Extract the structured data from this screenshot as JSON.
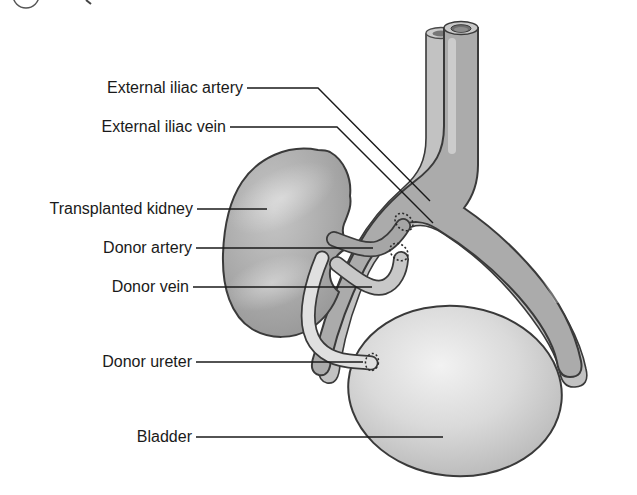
{
  "labels": {
    "external_iliac_artery": "External iliac artery",
    "external_iliac_vein": "External iliac vein",
    "transplanted_kidney": "Transplanted kidney",
    "donor_artery": "Donor artery",
    "donor_vein": "Donor vein",
    "donor_ureter": "Donor ureter",
    "bladder": "Bladder"
  },
  "colors": {
    "background": "#ffffff",
    "label_text": "#1a1a1a",
    "leader_line": "#1a1a1a",
    "outline": "#3a3a3a",
    "artery_fill": "#ababab",
    "vein_fill": "#c2c2c2",
    "donor_artery_fill": "#a6a6a6",
    "donor_vein_fill": "#c8c8c8",
    "ureter_fill": "#e0e0e0",
    "kidney_fill": "#a8a8a8",
    "bladder_fill": "#d2d2d2",
    "lumen_fill": "#6e6e6e"
  }
}
